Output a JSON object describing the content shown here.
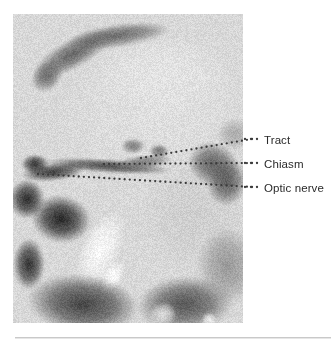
{
  "figure": {
    "type": "medical-mri-sagittal",
    "modality": "MRI",
    "view": "midsagittal",
    "panel": {
      "x": 13,
      "y": 14,
      "width": 230,
      "height": 309,
      "background_gray": "#b9b9b9"
    },
    "rule": {
      "color": "#c9c9c9",
      "shadow_color": "#e6e6e6",
      "x": 15,
      "y": 337,
      "width": 316
    }
  },
  "annotations": [
    {
      "id": "tract",
      "label": "Tract",
      "label_x": 264,
      "label_y": 134,
      "leader": {
        "dot_color": "#3a3a3a",
        "dot_radius": 1.15,
        "spacing": 5.0,
        "points": [
          {
            "x": 141,
            "y": 158
          },
          {
            "x": 252,
            "y": 139
          }
        ],
        "gap_dots": [
          {
            "x": 245,
            "y": 139
          },
          {
            "x": 251,
            "y": 139
          },
          {
            "x": 257,
            "y": 139
          }
        ]
      }
    },
    {
      "id": "chiasm",
      "label": "Chiasm",
      "label_x": 264,
      "label_y": 158,
      "leader": {
        "dot_color": "#3a3a3a",
        "dot_radius": 1.15,
        "spacing": 5.0,
        "points": [
          {
            "x": 104,
            "y": 164
          },
          {
            "x": 252,
            "y": 163
          }
        ],
        "gap_dots": [
          {
            "x": 245,
            "y": 163
          },
          {
            "x": 251,
            "y": 163
          },
          {
            "x": 257,
            "y": 163
          }
        ]
      }
    },
    {
      "id": "optic-nerve",
      "label": "Optic nerve",
      "label_x": 264,
      "label_y": 182,
      "leader": {
        "dot_color": "#3a3a3a",
        "dot_radius": 1.15,
        "spacing": 5.0,
        "points": [
          {
            "x": 38,
            "y": 174
          },
          {
            "x": 252,
            "y": 187
          }
        ],
        "gap_dots": [
          {
            "x": 245,
            "y": 187
          },
          {
            "x": 251,
            "y": 187
          },
          {
            "x": 257,
            "y": 187
          }
        ]
      }
    }
  ],
  "mri_structures": {
    "base_gray": 216,
    "noise_amplitude": 13,
    "blobs": [
      {
        "name": "corpus-callosum-genu",
        "cx": 60,
        "cy": 40,
        "rx": 44,
        "ry": 15,
        "rot": -28,
        "gray": 95,
        "blur": 9
      },
      {
        "name": "corpus-callosum-body",
        "cx": 105,
        "cy": 22,
        "rx": 52,
        "ry": 12,
        "rot": -8,
        "gray": 98,
        "blur": 10
      },
      {
        "name": "callosum-tip",
        "cx": 34,
        "cy": 62,
        "rx": 18,
        "ry": 14,
        "rot": -45,
        "gray": 105,
        "blur": 8
      },
      {
        "name": "brain-parenchyma",
        "cx": 140,
        "cy": 95,
        "rx": 100,
        "ry": 80,
        "rot": 0,
        "gray": 224,
        "blur": 24
      },
      {
        "name": "pons-region",
        "cx": 180,
        "cy": 200,
        "rx": 52,
        "ry": 56,
        "rot": 0,
        "gray": 206,
        "blur": 20
      },
      {
        "name": "suprasellar-dark-band",
        "cx": 95,
        "cy": 152,
        "rx": 64,
        "ry": 7,
        "rot": 4,
        "gray": 70,
        "blur": 6
      },
      {
        "name": "sella-dark",
        "cx": 40,
        "cy": 158,
        "rx": 32,
        "ry": 9,
        "rot": -6,
        "gray": 55,
        "blur": 5
      },
      {
        "name": "chiasm-dark",
        "cx": 130,
        "cy": 148,
        "rx": 30,
        "ry": 7,
        "rot": -6,
        "gray": 120,
        "blur": 6
      },
      {
        "name": "tract-dark",
        "cx": 200,
        "cy": 150,
        "rx": 26,
        "ry": 22,
        "rot": 20,
        "gray": 92,
        "blur": 7
      },
      {
        "name": "midbrain-dark",
        "cx": 214,
        "cy": 168,
        "rx": 20,
        "ry": 24,
        "rot": 10,
        "gray": 88,
        "blur": 8
      },
      {
        "name": "infundibulum",
        "cx": 120,
        "cy": 132,
        "rx": 12,
        "ry": 8,
        "rot": 0,
        "gray": 120,
        "blur": 6
      },
      {
        "name": "mammillary",
        "cx": 146,
        "cy": 137,
        "rx": 10,
        "ry": 7,
        "rot": 0,
        "gray": 110,
        "blur": 5
      },
      {
        "name": "sphenoid-sinus-air",
        "cx": 48,
        "cy": 205,
        "rx": 30,
        "ry": 24,
        "rot": 10,
        "gray": 28,
        "blur": 9
      },
      {
        "name": "nasal-dark-1",
        "cx": 14,
        "cy": 185,
        "rx": 18,
        "ry": 20,
        "rot": 0,
        "gray": 35,
        "blur": 9
      },
      {
        "name": "nasal-dark-2",
        "cx": 16,
        "cy": 250,
        "rx": 16,
        "ry": 26,
        "rot": 0,
        "gray": 40,
        "blur": 10
      },
      {
        "name": "clivus-marrow-bright",
        "cx": 88,
        "cy": 235,
        "rx": 20,
        "ry": 42,
        "rot": 24,
        "gray": 250,
        "blur": 5
      },
      {
        "name": "clivus-bright-tip",
        "cx": 100,
        "cy": 262,
        "rx": 10,
        "ry": 18,
        "rot": 30,
        "gray": 252,
        "blur": 4
      },
      {
        "name": "skull-base-dark",
        "cx": 70,
        "cy": 290,
        "rx": 56,
        "ry": 30,
        "rot": 6,
        "gray": 60,
        "blur": 12
      },
      {
        "name": "posterior-fossa-dark",
        "cx": 172,
        "cy": 290,
        "rx": 48,
        "ry": 28,
        "rot": -4,
        "gray": 78,
        "blur": 14
      },
      {
        "name": "cerebellum",
        "cx": 214,
        "cy": 252,
        "rx": 30,
        "ry": 40,
        "rot": 0,
        "gray": 150,
        "blur": 14
      },
      {
        "name": "brainstem-bright",
        "cx": 150,
        "cy": 300,
        "rx": 14,
        "ry": 12,
        "rot": 0,
        "gray": 230,
        "blur": 6
      },
      {
        "name": "bright-spot-low",
        "cx": 196,
        "cy": 306,
        "rx": 8,
        "ry": 8,
        "rot": 0,
        "gray": 240,
        "blur": 5
      },
      {
        "name": "orbit-dark",
        "cx": 22,
        "cy": 150,
        "rx": 14,
        "ry": 10,
        "rot": 0,
        "gray": 45,
        "blur": 6
      },
      {
        "name": "temporal-dark",
        "cx": 222,
        "cy": 120,
        "rx": 18,
        "ry": 16,
        "rot": 0,
        "gray": 170,
        "blur": 12
      },
      {
        "name": "frontal-bright",
        "cx": 150,
        "cy": 60,
        "rx": 70,
        "ry": 40,
        "rot": 0,
        "gray": 228,
        "blur": 22
      }
    ]
  }
}
